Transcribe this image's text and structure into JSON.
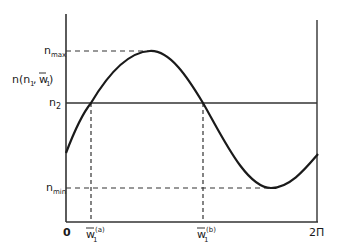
{
  "diagram": {
    "y_axis_label": {
      "main": "n(n",
      "sub1": "1",
      "mid": ", ",
      "wbar": "w",
      "sub2": "1",
      "close": ")"
    },
    "levels": {
      "n_max": {
        "base": "n",
        "sub": "max"
      },
      "n_2": {
        "base": "n",
        "sub": "2"
      },
      "n_min": {
        "base": "n",
        "sub": "min"
      }
    },
    "x_ticks": {
      "zero": "0",
      "w_a": {
        "base": "w",
        "sub": "1",
        "sup": "(a)"
      },
      "w_b": {
        "base": "w",
        "sub": "1",
        "sup": "(b)"
      },
      "two_pi": "2Π"
    },
    "curve": "sinusoid over [0, 2Π] oscillating between n_min and n_max, crossing n_2 at w_1^(a) and w_1^(b)",
    "colors": {
      "ink": "#1a1a1a",
      "background": "#ffffff"
    }
  }
}
